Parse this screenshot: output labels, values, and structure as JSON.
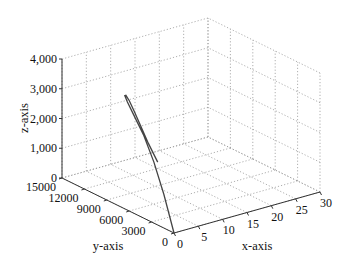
{
  "chart_data": {
    "type": "line3d",
    "title": "",
    "xlabel": "x-axis",
    "ylabel": "y-axis",
    "zlabel": "z-axis",
    "xlim": [
      0,
      30
    ],
    "ylim": [
      0,
      15000
    ],
    "zlim": [
      0,
      4000
    ],
    "x_ticks": [
      "0",
      "5",
      "10",
      "15",
      "20",
      "25",
      "30"
    ],
    "y_ticks": [
      "0",
      "3000",
      "6000",
      "9000",
      "12000",
      "15000"
    ],
    "z_ticks": [
      "0",
      "1,000",
      "2,000",
      "3,000",
      "4,000"
    ],
    "grid": true,
    "legend": null,
    "series": [
      {
        "name": "trajectory",
        "color": "#444444",
        "points": [
          {
            "x": 0,
            "y": 0,
            "z": 0
          },
          {
            "x": 1.0,
            "y": 2000,
            "z": 1000
          },
          {
            "x": 2.0,
            "y": 4000,
            "z": 1800
          },
          {
            "x": 3.0,
            "y": 6000,
            "z": 2400
          },
          {
            "x": 4.0,
            "y": 8000,
            "z": 2800
          },
          {
            "x": 5.0,
            "y": 9500,
            "z": 3000
          },
          {
            "x": 6.0,
            "y": 10500,
            "z": 3050
          },
          {
            "x": 7.0,
            "y": 11000,
            "z": 2950
          },
          {
            "x": 8.0,
            "y": 11200,
            "z": 2700
          },
          {
            "x": 9.0,
            "y": 11200,
            "z": 2300
          },
          {
            "x": 10.0,
            "y": 11000,
            "z": 1800
          },
          {
            "x": 11.0,
            "y": 10600,
            "z": 1200
          },
          {
            "x": 12.0,
            "y": 10000,
            "z": 600
          }
        ]
      }
    ]
  },
  "axes": {
    "x_label": "x-axis",
    "y_label": "y-axis",
    "z_label": "z-axis"
  }
}
